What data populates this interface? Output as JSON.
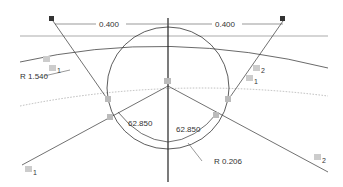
{
  "diagram": {
    "dimensions": {
      "top_left": "0.400",
      "top_right": "0.400",
      "radius_large": "R 1.540",
      "radius_small": "R 0.206",
      "angle_left": "62.850",
      "angle_right": "62.850"
    },
    "constraint_labels": {
      "a1_upper": "1",
      "a1_lower": "1",
      "a2_upper": "2",
      "a2_lower": "1",
      "bottom_left": "1",
      "bottom_right": "2"
    },
    "colors": {
      "line": "#333333",
      "dotted": "#aaaaaa",
      "marker": "#555555",
      "background": "#ffffff"
    }
  }
}
